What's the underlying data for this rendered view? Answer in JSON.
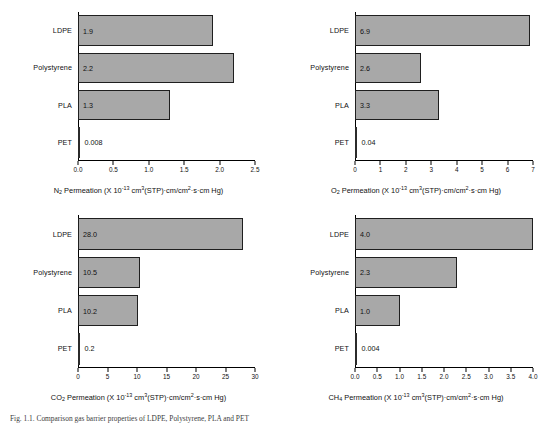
{
  "figure": {
    "caption": "Fig. 1.1. Comparison gas barrier properties of LDPE, Polystyrene, PLA and PET"
  },
  "chart_data": [
    {
      "id": "n2",
      "type": "bar",
      "orientation": "horizontal",
      "gas": "N2",
      "title": "",
      "xlabel_parts": {
        "gas": "N",
        "gas_sub": "2",
        "text_before": " Permeation (X 10",
        "exponent": "-13",
        "text_after": " cm",
        "cm_sup": "3",
        "text_mid": "(STP)·cm/cm",
        "cm2_sup": "2",
        "text_end": "·s·cm Hg)"
      },
      "xlabel": "N2 Permeation (X 10-13 cm3(STP)·cm/cm2·s·cm Hg)",
      "ylabel": "",
      "categories": [
        "LDPE",
        "Polystyrene",
        "PLA",
        "PET"
      ],
      "values": [
        1.9,
        2.2,
        1.3,
        0.006
      ],
      "value_labels": [
        "1.9",
        "2.2",
        "1.3",
        "0.008"
      ],
      "xlim": [
        0,
        2.5
      ],
      "xticks": [
        0.0,
        0.5,
        1.0,
        1.5,
        2.0,
        2.5
      ],
      "xtick_labels": [
        "0.0",
        "0.5",
        "1.0",
        "1.5",
        "2.0",
        "2.5"
      ],
      "grid": false,
      "legend": "none"
    },
    {
      "id": "o2",
      "type": "bar",
      "orientation": "horizontal",
      "gas": "O2",
      "title": "",
      "xlabel_parts": {
        "gas": "O",
        "gas_sub": "2",
        "text_before": " Permeation (X 10",
        "exponent": "-13",
        "text_after": " cm",
        "cm_sup": "3",
        "text_mid": "(STP)·cm/cm",
        "cm2_sup": "2",
        "text_end": "·s·cm Hg)"
      },
      "xlabel": "O2 Permeation (X 10-13 cm3(STP)·cm/cm2·s·cm Hg)",
      "ylabel": "",
      "categories": [
        "LDPE",
        "Polystyrene",
        "PLA",
        "PET"
      ],
      "values": [
        6.9,
        2.6,
        3.3,
        0.04
      ],
      "value_labels": [
        "6.9",
        "2.6",
        "3.3",
        "0.04"
      ],
      "xlim": [
        0,
        7
      ],
      "xticks": [
        0,
        1,
        2,
        3,
        4,
        5,
        6,
        7
      ],
      "xtick_labels": [
        "0",
        "1",
        "2",
        "3",
        "4",
        "5",
        "6",
        "7"
      ],
      "grid": false,
      "legend": "none"
    },
    {
      "id": "co2",
      "type": "bar",
      "orientation": "horizontal",
      "gas": "CO2",
      "title": "",
      "xlabel_parts": {
        "gas": "CO",
        "gas_sub": "2",
        "text_before": " Permeation (X 10",
        "exponent": "-13",
        "text_after": " cm",
        "cm_sup": "3",
        "text_mid": "(STP)·cm/cm",
        "cm2_sup": "2",
        "text_end": "·s·cm Hg)"
      },
      "xlabel": "CO2 Permeation (X 10-13 cm3(STP)·cm/cm2·s·cm Hg)",
      "ylabel": "",
      "categories": [
        "LDPE",
        "Polystyrene",
        "PLA",
        "PET"
      ],
      "values": [
        28.0,
        10.5,
        10.2,
        0.2
      ],
      "value_labels": [
        "28.0",
        "10.5",
        "10.2",
        "0.2"
      ],
      "xlim": [
        0,
        30
      ],
      "xticks": [
        0,
        5,
        10,
        15,
        20,
        25,
        30
      ],
      "xtick_labels": [
        "0",
        "5",
        "10",
        "15",
        "20",
        "25",
        "30"
      ],
      "grid": false,
      "legend": "none"
    },
    {
      "id": "ch4",
      "type": "bar",
      "orientation": "horizontal",
      "gas": "CH4",
      "title": "",
      "xlabel_parts": {
        "gas": "CH",
        "gas_sub": "4",
        "text_before": " Permeation (X 10",
        "exponent": "-13",
        "text_after": " cm",
        "cm_sup": "3",
        "text_mid": "(STP)·cm/cm",
        "cm2_sup": "2",
        "text_end": "·s·cm Hg)"
      },
      "xlabel": "CH4 Permeation (X 10-13 cm3(STP)·cm/cm2·s·cm Hg)",
      "ylabel": "",
      "categories": [
        "LDPE",
        "Polystyrene",
        "PLA",
        "PET"
      ],
      "values": [
        4.0,
        2.3,
        1.0,
        0.004
      ],
      "value_labels": [
        "4.0",
        "2.3",
        "1.0",
        "0.004"
      ],
      "xlim": [
        0,
        4.0
      ],
      "xticks": [
        0.0,
        0.5,
        1.0,
        1.5,
        2.0,
        2.5,
        3.0,
        3.5,
        4.0
      ],
      "xtick_labels": [
        "0.0",
        "0.5",
        "1.0",
        "1.5",
        "2.0",
        "2.5",
        "3.0",
        "3.5",
        "4.0"
      ],
      "grid": false,
      "legend": "none"
    }
  ],
  "style": {
    "bar_fill": "#a8a8a8",
    "bar_stroke": "#1f1f1f",
    "axis_color": "#000000",
    "text_color": "#111111",
    "background": "#ffffff"
  }
}
